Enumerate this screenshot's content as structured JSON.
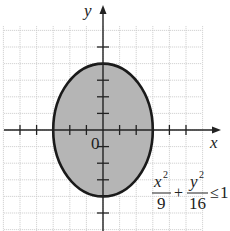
{
  "chart_data": {
    "type": "area",
    "title": "",
    "xlabel": "x",
    "ylabel": "y",
    "origin_label": "0",
    "inequality": {
      "x_numerator": "x",
      "x_exponent": "2",
      "x_denominator": "9",
      "plus": "+",
      "y_numerator": "y",
      "y_exponent": "2",
      "y_denominator": "16",
      "relation": "≤",
      "rhs": "1"
    },
    "ellipse": {
      "a": 3,
      "b": 4,
      "center": [
        0,
        0
      ],
      "filled": true
    },
    "xlim": [
      -6,
      6
    ],
    "ylim": [
      -6,
      7
    ],
    "x_ticks": [
      -5,
      -4,
      -3,
      -2,
      -1,
      1,
      2,
      3,
      4,
      5
    ],
    "y_ticks": [
      -5,
      -4,
      -3,
      -2,
      -1,
      1,
      2,
      3,
      4,
      5
    ],
    "grid": true,
    "colors": {
      "fill": "#b5b5b5",
      "outline": "#1a1a1a",
      "grid": "#c8c8c8",
      "axis": "#222222"
    }
  }
}
